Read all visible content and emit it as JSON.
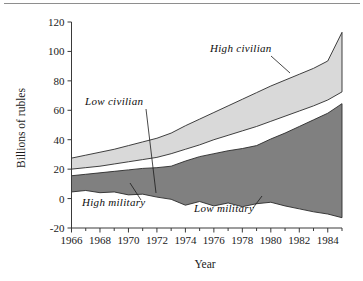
{
  "figure": {
    "name": "soviet-defense-spending-estimates",
    "background_color": "#ffffff",
    "frame_color": "#8e8e8e"
  },
  "chart_data": {
    "type": "area",
    "title": "",
    "subtitle": "",
    "xlabel": "Year",
    "ylabel": "Billions of rubles",
    "xlim": [
      1966,
      1985
    ],
    "ylim": [
      -20,
      120
    ],
    "grid": false,
    "legend_position": "inline-annotations",
    "xticks": [
      1966,
      1968,
      1970,
      1972,
      1974,
      1976,
      1978,
      1980,
      1982,
      1984
    ],
    "xtick_labels": [
      "1966",
      "1968",
      "1970",
      "1972",
      "1974",
      "1976",
      "1978",
      "1980",
      "1982",
      "1984"
    ],
    "yticks": [
      -20,
      0,
      20,
      40,
      60,
      80,
      100,
      120
    ],
    "ytick_labels": [
      "-20",
      "0",
      "20",
      "40",
      "60",
      "80",
      "100",
      "120"
    ],
    "x": [
      1966,
      1967,
      1968,
      1969,
      1970,
      1971,
      1972,
      1973,
      1974,
      1975,
      1976,
      1977,
      1978,
      1979,
      1980,
      1981,
      1982,
      1983,
      1984,
      1985
    ],
    "series": [
      {
        "name": "High civilian",
        "fill_color": "#d9d9d9",
        "values": [
          27.5,
          29.5,
          31.5,
          33.5,
          36.0,
          38.5,
          41.0,
          44.5,
          49.5,
          54.0,
          58.5,
          63.0,
          67.5,
          72.0,
          76.5,
          80.5,
          84.5,
          88.5,
          93.5,
          113.0
        ]
      },
      {
        "name": "Low civilian",
        "fill_color": "#ffffff",
        "values": [
          20.0,
          21.0,
          22.0,
          23.5,
          25.0,
          26.5,
          28.0,
          30.5,
          33.5,
          36.5,
          40.0,
          43.0,
          46.0,
          49.0,
          52.5,
          56.0,
          59.5,
          63.0,
          67.0,
          72.5
        ]
      },
      {
        "name": "High military",
        "fill_color": "#808080",
        "values": [
          15.5,
          16.5,
          17.5,
          18.5,
          19.5,
          20.5,
          21.0,
          22.0,
          25.5,
          28.5,
          30.5,
          32.5,
          34.0,
          36.0,
          40.5,
          44.5,
          49.0,
          53.5,
          58.0,
          64.5
        ]
      },
      {
        "name": "Low military",
        "fill_color": "#ffffff",
        "values": [
          4.5,
          5.5,
          4.0,
          4.5,
          2.5,
          3.0,
          1.0,
          -0.5,
          -4.5,
          -2.0,
          -5.0,
          -3.0,
          -5.5,
          -3.5,
          -2.5,
          -5.0,
          -7.0,
          -9.0,
          -10.5,
          -13.0
        ]
      }
    ],
    "annotations": [
      {
        "text": "High civilian",
        "target_series": "High civilian",
        "x_text": 210,
        "y_text": 52,
        "leader_from": [
          271,
          56
        ],
        "leader_to": [
          290,
          73
        ]
      },
      {
        "text": "Low civilian",
        "target_series": "Low civilian",
        "x_text": 85,
        "y_text": 105,
        "leader_from": [
          146,
          109
        ],
        "leader_to": [
          156,
          193
        ]
      },
      {
        "text": "High military",
        "target_series": "High military",
        "x_text": 82,
        "y_text": 206,
        "leader_from": [
          141,
          200
        ],
        "leader_to": [
          130,
          183
        ]
      },
      {
        "text": "Low military",
        "target_series": "Low military",
        "x_text": 194,
        "y_text": 212,
        "leader_from": [
          253,
          208
        ],
        "leader_to": [
          262,
          196
        ]
      }
    ]
  },
  "axes": {
    "y_axis_title": "Billions of rubles",
    "x_axis_title": "Year"
  }
}
